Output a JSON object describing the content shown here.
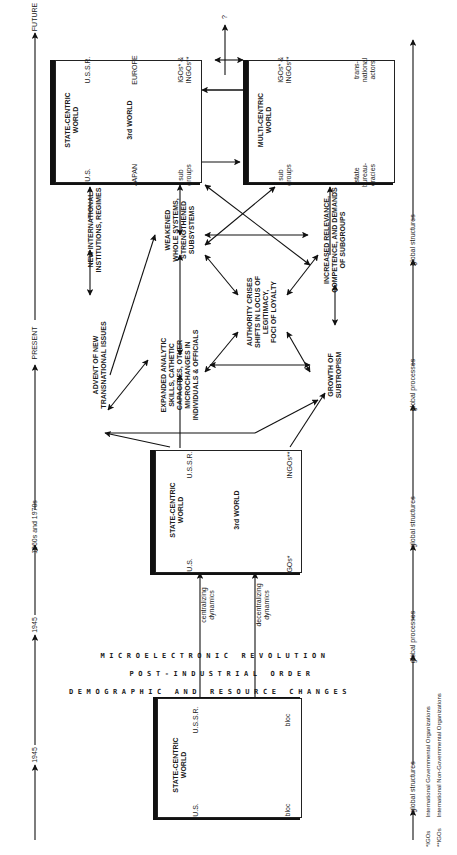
{
  "timeline": {
    "labels": [
      "1945",
      "1945",
      "1960s and 1970s",
      "PRESENT",
      "FUTURE"
    ]
  },
  "axis": {
    "labels": [
      "global structures",
      "global processes",
      "global structures",
      "global processes",
      "global structures"
    ]
  },
  "boxes": {
    "box_1945": {
      "title": "STATE-CENTRIC\nWORLD",
      "nodes": {
        "us": "U.S.",
        "ussr": "U.S.S.R.",
        "bloc_us": "bloc",
        "bloc_ussr": "bloc"
      }
    },
    "box_1960s": {
      "title": "STATE-CENTRIC\nWORLD",
      "nodes": {
        "us": "U.S.",
        "ussr": "U.S.S.R.",
        "third_world": "3rd WORLD",
        "igos": "IGOs*",
        "ingos": "INGOs**"
      }
    },
    "box_future_state": {
      "title": "STATE-CENTRIC\nWORLD",
      "nodes": {
        "us": "U.S.",
        "ussr": "U.S.S.R.",
        "japan": "JAPAN",
        "europe": "EUROPE",
        "third_world": "3rd WORLD",
        "subgroups": "sub\ngroups",
        "igos_ingos": "IGOs* &\nINGOs**"
      }
    },
    "box_future_multi": {
      "title": "MULTI-CENTRIC\nWORLD",
      "nodes": {
        "subgroups": "sub\ngroups",
        "igos_ingos": "IGOs* &\nINGOs**",
        "state_bureaucracies": "state\nbureau-\ncracies",
        "transnational_actors": "trans-\nnational\nactors"
      }
    }
  },
  "transition": {
    "rows": [
      "MICROELECTRONIC REVOLUTION",
      "POST-INDUSTRIAL ORDER",
      "DEMOGRAPHIC AND RESOURCE CHANGES"
    ],
    "centralizing": "centralizing\ndynamics",
    "decentralizing": "decentralizing\ndynamics"
  },
  "processes": {
    "advent": "ADVENT OF NEW\nTRANSNATIONAL ISSUES",
    "new_institutions": "NEW INTERNATIONAL\nINSTITUTIONS, REGIMES",
    "expanded_skills": "EXPANDED ANALYTIC\nSKILLS, CATHETIC\nCAPACITIES, OTHER\nMICROCHANGES IN\nINDIVIDUALS & OFFICIALS",
    "weakened": "WEAKENED\nWHOLE SYSTEMS,\nSTRENGTHENED\nSUBSYSTEMS",
    "authority": "AUTHORITY CRISES\nSHIFTS IN LOCUS OF\nLEGITIMACY,\nFOCI OF LOYALTY",
    "subtropism": "GROWTH OF\nSUBTROPISM",
    "relevance": "INCREASED RELEVANCE,\nCOMPETENCE, AND DEMANDS\nOF SUBGROUPS",
    "unknown": "?"
  },
  "footnotes": [
    {
      "mark": "*IGOs",
      "text": "International Governmental Organizations"
    },
    {
      "mark": "**IGOs",
      "text": "International Non-Governmental Organizations"
    }
  ]
}
